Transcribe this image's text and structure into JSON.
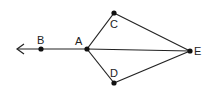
{
  "diagram": {
    "type": "geometry",
    "points": [
      {
        "id": "B",
        "label": "B",
        "x": 41,
        "y": 49,
        "lx": 37,
        "ly": 44
      },
      {
        "id": "A",
        "label": "A",
        "x": 87,
        "y": 49,
        "lx": 75,
        "ly": 45
      },
      {
        "id": "C",
        "label": "C",
        "x": 114,
        "y": 13,
        "lx": 111,
        "ly": 28
      },
      {
        "id": "D",
        "label": "D",
        "x": 114,
        "y": 83,
        "lx": 111,
        "ly": 77
      },
      {
        "id": "E",
        "label": "E",
        "x": 190,
        "y": 51,
        "lx": 194,
        "ly": 55
      }
    ],
    "ray": {
      "from": "A",
      "through": "B",
      "arrow_tip": {
        "x": 17,
        "y": 49
      }
    },
    "segments": [
      [
        "A",
        "C"
      ],
      [
        "A",
        "D"
      ],
      [
        "A",
        "E"
      ],
      [
        "C",
        "E"
      ],
      [
        "D",
        "E"
      ]
    ],
    "labels": {
      "B": "B",
      "A": "A",
      "C": "C",
      "D": "D",
      "E": "E"
    }
  }
}
